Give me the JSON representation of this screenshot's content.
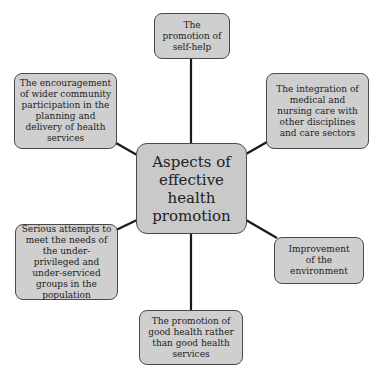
{
  "diagram": {
    "center": {
      "label": "Aspects of effective health promotion"
    },
    "nodes": [
      {
        "id": "top",
        "label": "The promotion of self-help"
      },
      {
        "id": "upper-left",
        "label": "The encouragement of wider community participation in the planning and delivery of health services"
      },
      {
        "id": "upper-right",
        "label": "The integration of medical and nursing care with other disciplines and care sectors"
      },
      {
        "id": "lower-left",
        "label": "Serious attempts to meet the needs of the under-privileged and under-serviced groups in the population"
      },
      {
        "id": "lower-right",
        "label": "Improvement of the environment"
      },
      {
        "id": "bottom",
        "label": "The promotion of good health rather than good health services"
      }
    ],
    "colors": {
      "box_fill": "#cfcfcf",
      "box_border": "#4a4a4a",
      "connector": "#1a1a1a",
      "text": "#222222"
    }
  }
}
